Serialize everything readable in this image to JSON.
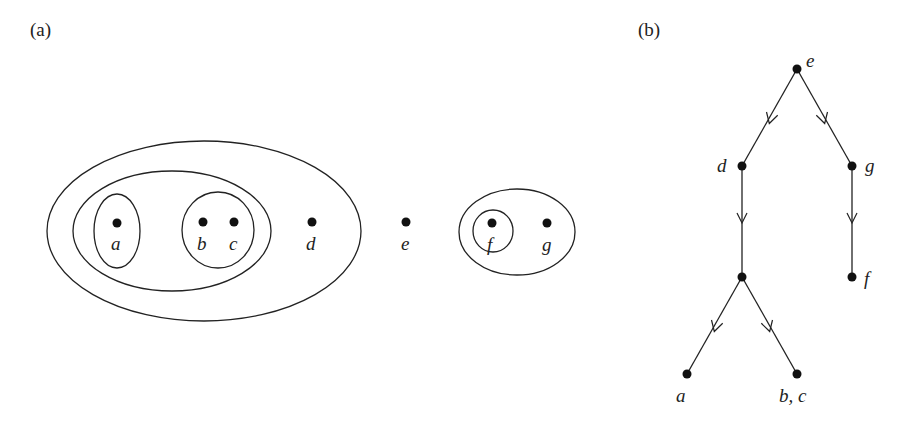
{
  "panel_a": {
    "label": "(a)",
    "description": "Nested set (Venn-style) diagram of elements a–g",
    "points": [
      {
        "id": "a",
        "label": "a",
        "x": 117,
        "y": 223
      },
      {
        "id": "b",
        "label": "b",
        "x": 203,
        "y": 222
      },
      {
        "id": "c",
        "label": "c",
        "x": 234,
        "y": 222
      },
      {
        "id": "d",
        "label": "d",
        "x": 312,
        "y": 222
      },
      {
        "id": "e",
        "label": "e",
        "x": 406,
        "y": 222
      },
      {
        "id": "f",
        "label": "f",
        "x": 492,
        "y": 223
      },
      {
        "id": "g",
        "label": "g",
        "x": 547,
        "y": 223
      }
    ],
    "sets": [
      {
        "name": "{a,b,c,d}",
        "cx": 204,
        "cy": 231,
        "rx": 157,
        "ry": 90
      },
      {
        "name": "{a,b,c}",
        "cx": 172,
        "cy": 231,
        "rx": 99,
        "ry": 60
      },
      {
        "name": "{a}",
        "cx": 117,
        "cy": 231,
        "rx": 23,
        "ry": 37
      },
      {
        "name": "{b,c}",
        "cx": 218,
        "cy": 230,
        "rx": 36,
        "ry": 38
      },
      {
        "name": "{f,g}",
        "cx": 517,
        "cy": 232,
        "rx": 58,
        "ry": 43
      },
      {
        "name": "{f}",
        "cx": 493,
        "cy": 231,
        "rx": 20,
        "ry": 21
      }
    ]
  },
  "panel_b": {
    "label": "(b)",
    "description": "Directed tree (Hasse diagram) corresponding to the nested sets",
    "nodes": [
      {
        "id": "e",
        "label": "e",
        "x": 797,
        "y": 69
      },
      {
        "id": "d",
        "label": "d",
        "x": 742,
        "y": 166
      },
      {
        "id": "g",
        "label": "g",
        "x": 852,
        "y": 166
      },
      {
        "id": "m",
        "label": "",
        "x": 742,
        "y": 277
      },
      {
        "id": "f",
        "label": "f",
        "x": 852,
        "y": 277
      },
      {
        "id": "a",
        "label": "a",
        "x": 687,
        "y": 374
      },
      {
        "id": "bc",
        "label": "b, c",
        "x": 797,
        "y": 374
      }
    ],
    "edges": [
      {
        "from": "e",
        "to": "d"
      },
      {
        "from": "e",
        "to": "g"
      },
      {
        "from": "d",
        "to": "m"
      },
      {
        "from": "g",
        "to": "f"
      },
      {
        "from": "m",
        "to": "a"
      },
      {
        "from": "m",
        "to": "bc"
      }
    ]
  }
}
